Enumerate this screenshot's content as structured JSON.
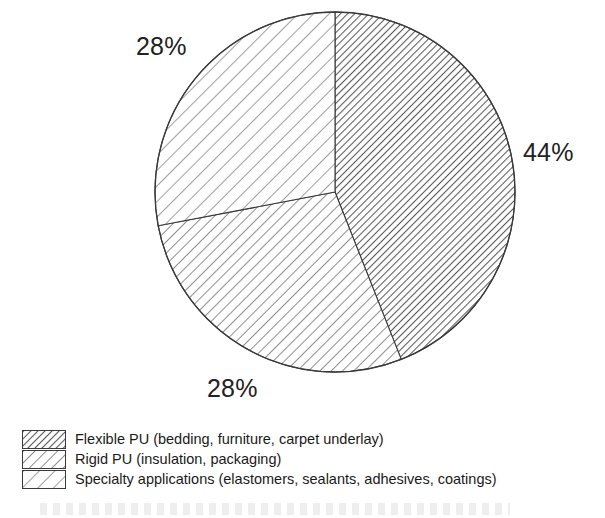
{
  "chart_data": {
    "type": "pie",
    "title": "",
    "subtitle": "",
    "xlabel": "",
    "ylabel": "",
    "legend_position": "bottom-left",
    "grid": false,
    "start_angle_deg": 0,
    "direction": "clockwise",
    "units": "percent",
    "categories": [
      "Flexible PU (bedding, furniture, carpet underlay)",
      "Rigid PU (insulation, packaging)",
      "Specialty applications (elastomers, sealants, adhesives, coatings)"
    ],
    "values": [
      44,
      28,
      28
    ],
    "data_labels": [
      "44%",
      "28%",
      "28%"
    ],
    "slices": [
      {
        "label": "Flexible PU (bedding, furniture, carpet underlay)",
        "value": 44,
        "data_label": "44%",
        "hatch": "dense-diagonal",
        "start_deg": 0,
        "end_deg": 158.4,
        "label_anchor": "right"
      },
      {
        "label": "Rigid PU (insulation, packaging)",
        "value": 28,
        "data_label": "28%",
        "hatch": "medium-diagonal",
        "start_deg": 158.4,
        "end_deg": 259.2,
        "label_anchor": "bottom"
      },
      {
        "label": "Specialty applications (elastomers, sealants, adhesives, coatings)",
        "value": 28,
        "data_label": "28%",
        "hatch": "coarse-diagonal",
        "start_deg": 259.2,
        "end_deg": 360,
        "label_anchor": "upper-left"
      }
    ]
  },
  "pie": {
    "labels": {
      "right": "44%",
      "upper_left": "28%",
      "bottom": "28%"
    }
  },
  "legend": {
    "items": [
      {
        "swatch": "dense-diagonal-hatch-swatch",
        "label": "Flexible PU (bedding, furniture, carpet underlay)"
      },
      {
        "swatch": "medium-diagonal-hatch-swatch",
        "label": "Rigid PU (insulation, packaging)"
      },
      {
        "swatch": "coarse-diagonal-hatch-swatch",
        "label": "Specialty applications (elastomers, sealants, adhesives, coatings)"
      }
    ]
  },
  "colors": {
    "background": "#ffffff",
    "outline": "#3a3a3a",
    "hatch": "#5a5a5a",
    "text": "#1a1a1a"
  }
}
